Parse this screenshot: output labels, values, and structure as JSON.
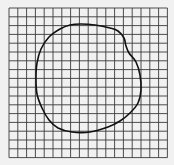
{
  "figure": {
    "grid": {
      "columns": 18,
      "rows": 17,
      "origin": [
        9,
        8
      ],
      "cell_size": 8.8,
      "line_color": "#3a3a3a",
      "background": "#f1f1f1"
    },
    "curve": {
      "closed": true,
      "stroke": "#111111",
      "stroke_width": 1.6,
      "points": [
        [
          81,
          24
        ],
        [
          95,
          25
        ],
        [
          110,
          28
        ],
        [
          118,
          31
        ],
        [
          124,
          38
        ],
        [
          126,
          46
        ],
        [
          129,
          53
        ],
        [
          136,
          62
        ],
        [
          140,
          75
        ],
        [
          141,
          90
        ],
        [
          138,
          103
        ],
        [
          130,
          113
        ],
        [
          120,
          121
        ],
        [
          108,
          127
        ],
        [
          90,
          132
        ],
        [
          72,
          132
        ],
        [
          58,
          128
        ],
        [
          49,
          120
        ],
        [
          42,
          108
        ],
        [
          37,
          94
        ],
        [
          36,
          78
        ],
        [
          37,
          63
        ],
        [
          41,
          49
        ],
        [
          49,
          37
        ],
        [
          60,
          29
        ],
        [
          70,
          25
        ]
      ]
    }
  }
}
